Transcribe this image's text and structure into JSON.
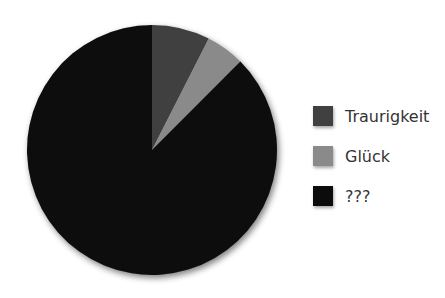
{
  "chart_data": {
    "type": "pie",
    "title": "",
    "categories": [
      "Traurigkeit",
      "Glück",
      "???"
    ],
    "values": [
      7.5,
      5,
      87.5
    ],
    "colors": [
      "#404040",
      "#8a8a8a",
      "#0c0c0c"
    ],
    "start_angle_deg": 0,
    "direction": "clockwise",
    "legend_position": "right"
  },
  "legend": {
    "items": [
      {
        "label": "Traurigkeit",
        "color": "#404040"
      },
      {
        "label": "Glück",
        "color": "#8a8a8a"
      },
      {
        "label": "???",
        "color": "#0c0c0c"
      }
    ]
  }
}
